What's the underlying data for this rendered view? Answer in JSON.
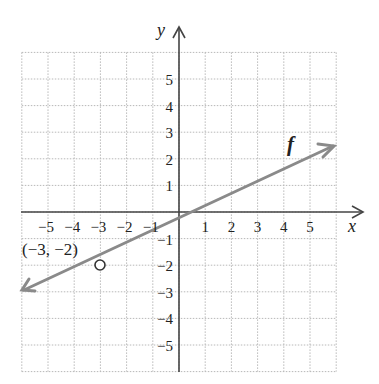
{
  "chart_data": {
    "type": "line",
    "title": "",
    "xlabel": "x",
    "ylabel": "y",
    "function_label": "f",
    "xlim": [
      -6,
      6
    ],
    "ylim": [
      -6,
      6
    ],
    "grid": true,
    "x_ticks": [
      "-5",
      "-4",
      "-3",
      "-2",
      "-1",
      "1",
      "2",
      "3",
      "4",
      "5"
    ],
    "y_ticks": [
      "5",
      "4",
      "3",
      "2",
      "1",
      "-1",
      "-2",
      "-3",
      "-4",
      "-5"
    ],
    "series": [
      {
        "name": "f",
        "equation": "y = 0.5x - 0.5",
        "x": [
          -6,
          6
        ],
        "y": [
          -3.5,
          2.5
        ],
        "arrows": "both"
      }
    ],
    "annotations": [
      {
        "type": "open-point",
        "x": -3,
        "y": -2,
        "label": "(−3, −2)"
      }
    ],
    "colors": {
      "line": "#8a8a8a",
      "axes": "#444444",
      "grid": "#b5b5b5"
    }
  },
  "labels": {
    "x_axis": "x",
    "y_axis": "y",
    "f": "f",
    "point": "(−3, −2)",
    "xticks": [
      "−5",
      "−4",
      "−3",
      "−2",
      "−1",
      "1",
      "2",
      "3",
      "4",
      "5"
    ],
    "yticks": [
      "5",
      "4",
      "3",
      "2",
      "1",
      "−1",
      "−2",
      "−3",
      "−4",
      "−5"
    ]
  }
}
